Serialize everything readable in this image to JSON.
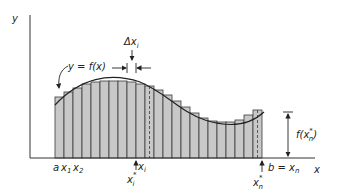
{
  "diagram": {
    "colors": {
      "bar_fill": "#c8c8c8",
      "bar_stroke": "#3a3a3a",
      "curve": "#222222",
      "axis": "#333333",
      "text": "#222222"
    },
    "axes": {
      "y_label": "y",
      "x_label": "x"
    },
    "curve_label": "y = f(x)",
    "delta_label": {
      "main": "Δx",
      "sub": "i"
    },
    "tick_labels": {
      "a": "a",
      "x1": "x",
      "x1_sub": "1",
      "x2": "x",
      "x2_sub": "2",
      "xi": "x",
      "xi_sub": "i",
      "xi_star": "x",
      "xi_star_sub": "i",
      "xi_star_sup": "*",
      "b_eq": "b = x",
      "b_sub": "n",
      "xn_star": "x",
      "xn_star_sub": "n",
      "xn_star_sup": "*"
    },
    "height_label": {
      "prefix": "f(x",
      "sub": "n",
      "sup": "*",
      "suffix": ")"
    },
    "bars": {
      "count": 23,
      "start_x": 55,
      "width": 9,
      "baseline_y": 158,
      "tops": [
        97,
        92,
        88,
        84,
        82,
        81,
        81,
        81,
        82,
        84,
        86,
        90,
        95,
        101,
        107,
        113,
        118,
        121,
        122,
        122,
        120,
        115,
        110
      ],
      "dashed_indices": [
        10,
        22
      ]
    }
  }
}
